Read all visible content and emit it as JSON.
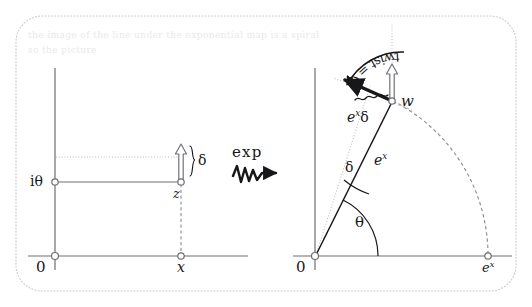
{
  "figure": {
    "border_style": "dotted-rounded",
    "colors": {
      "ink": "#17171a",
      "axis": "#6e6e73",
      "guide": "#b4b4ba",
      "border": "#c9c9cf",
      "background": "#ffffff",
      "faint_text": "#e9e9ec"
    }
  },
  "left_panel": {
    "name": "source-plane",
    "origin_label": "0",
    "imaginary_tick_label": "iθ",
    "real_tick_label": "x",
    "point_label": "z",
    "delta_label": "δ",
    "axes": {
      "horizontal": "real-axis",
      "vertical": "imaginary-axis"
    }
  },
  "map_arrow": {
    "name": "exp-map-arrow",
    "label": "exp",
    "style": "squiggly-arrow"
  },
  "right_panel": {
    "name": "image-plane",
    "origin_label": "0",
    "radius_tick_label": "e",
    "radius_tick_sup": "x",
    "point_label": "w",
    "angle_label": "θ",
    "delta_angle_label": "δ",
    "radius_label": "e",
    "radius_label_sup": "x",
    "scaled_delta_label": "e",
    "scaled_delta_label_sup": "x",
    "scaled_delta_label_tail": "δ",
    "twist_label": "twist = θ",
    "arc_style": "dashed-circular-arc"
  },
  "background_text": {
    "note": "faint show-through text from reverse of scanned page",
    "lines": [
      "the image of the line under the exponential map is a spiral",
      "so the picture"
    ]
  }
}
